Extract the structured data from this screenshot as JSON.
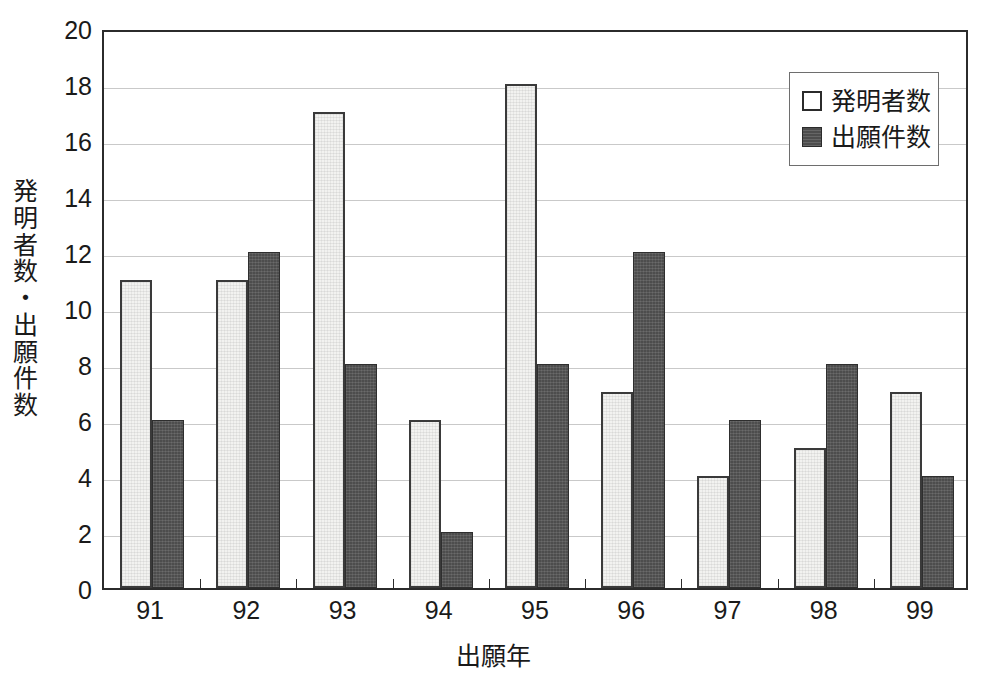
{
  "chart_data": {
    "type": "bar",
    "title": "",
    "subtitle": "",
    "xlabel": "出願年",
    "ylabel": "発明者数・出願件数",
    "categories": [
      "91",
      "92",
      "93",
      "94",
      "95",
      "96",
      "97",
      "98",
      "99"
    ],
    "series": [
      {
        "name": "発明者数",
        "color": "#f2f2f0",
        "values": [
          11,
          11,
          17,
          6,
          18,
          7,
          4,
          5,
          7
        ]
      },
      {
        "name": "出願件数",
        "color": "#4d4d4d",
        "values": [
          6,
          12,
          8,
          2,
          8,
          12,
          6,
          8,
          4
        ]
      }
    ],
    "ylim": [
      0,
      20
    ],
    "ytick_step": 2,
    "yticks": [
      "0",
      "2",
      "4",
      "6",
      "8",
      "10",
      "12",
      "14",
      "16",
      "18",
      "20"
    ],
    "grid": true,
    "grid_axis": "y",
    "legend_position": "top-right-inside",
    "legend_entries": [
      {
        "label": "発明者数",
        "swatch": "light-square"
      },
      {
        "label": "出願件数",
        "swatch": "dark-square"
      }
    ]
  }
}
